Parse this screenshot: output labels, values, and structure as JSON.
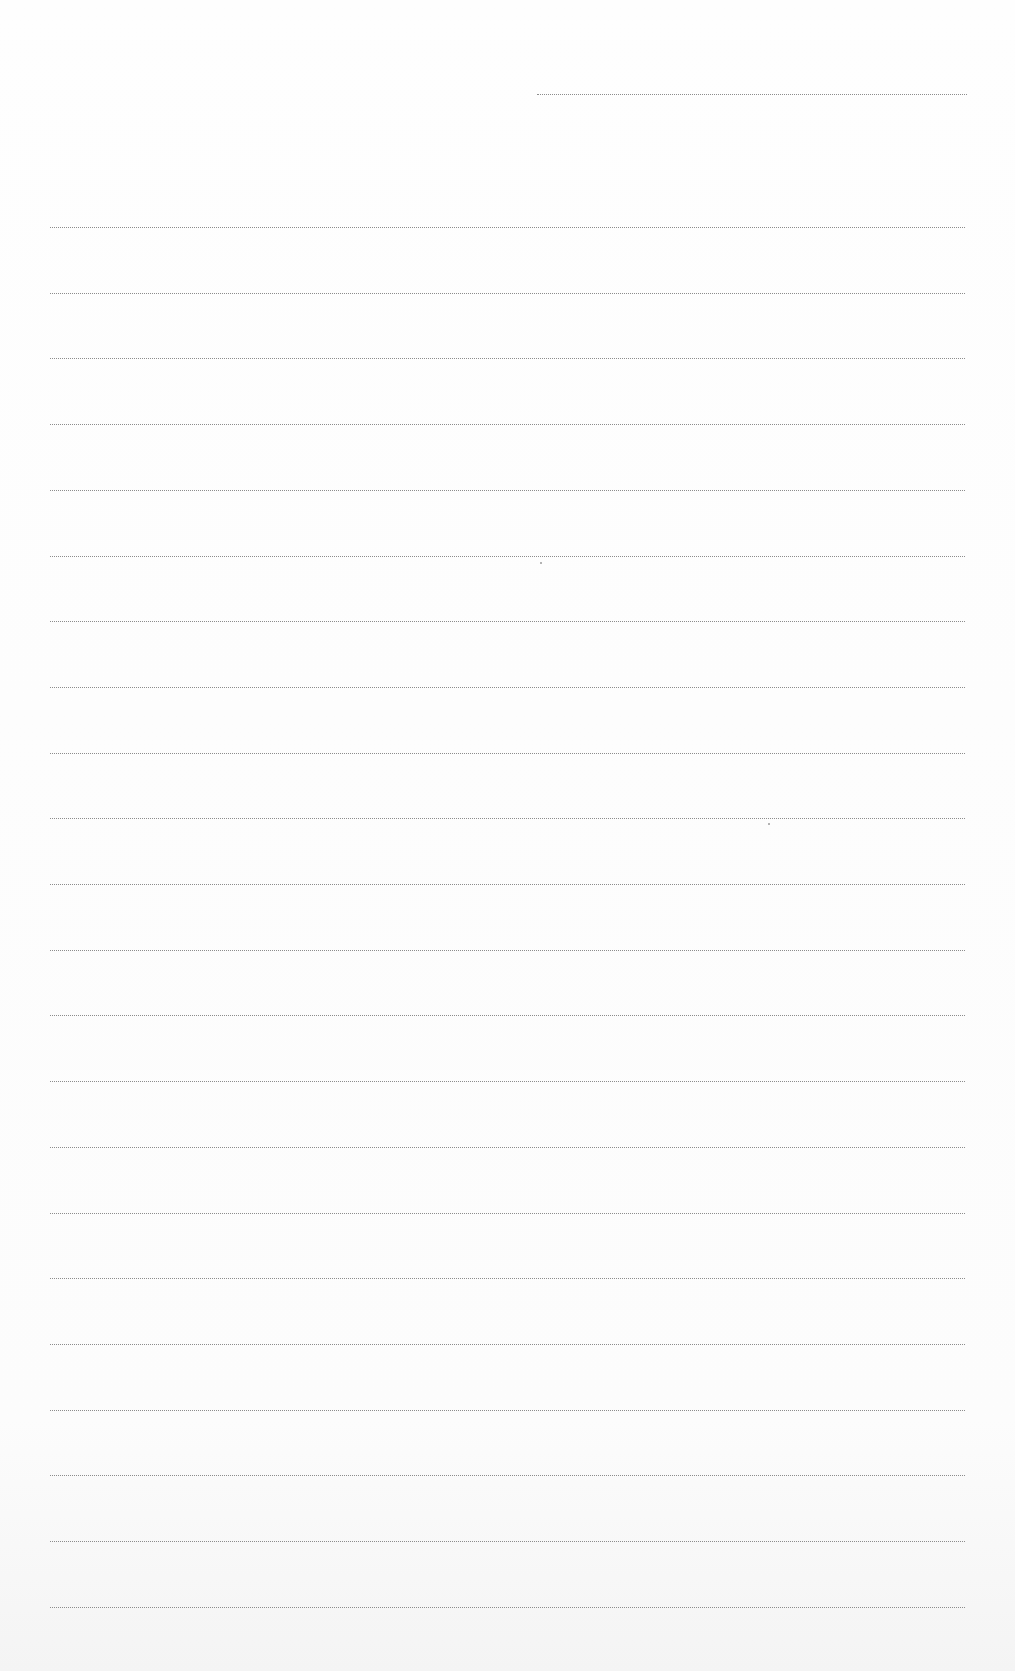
{
  "document": {
    "type": "blank ruled sheet",
    "header_line": {
      "x": 537,
      "y": 94,
      "width": 430
    },
    "ruled_lines": {
      "count": 22,
      "x": 50,
      "width": 915,
      "first_y": 227,
      "spacing": 65.7
    },
    "line_color": "#8c8c8c",
    "background_color": "#fdfdfd"
  }
}
